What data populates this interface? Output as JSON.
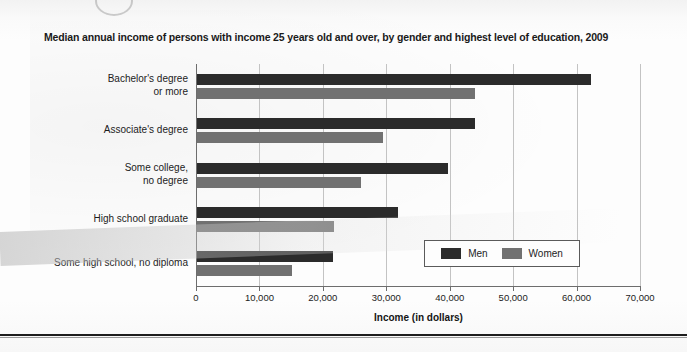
{
  "chart_data": {
    "type": "bar",
    "orientation": "horizontal",
    "title": "Median annual income of persons with income 25 years old and over, by gender and highest level of education, 2009",
    "xlabel": "Income (in dollars)",
    "ylabel": "",
    "xlim": [
      0,
      70000
    ],
    "xticks": [
      0,
      10000,
      20000,
      30000,
      40000,
      50000,
      60000,
      70000
    ],
    "xtick_labels": [
      "0",
      "10,000",
      "20,000",
      "30,000",
      "40,000",
      "50,000",
      "60,000",
      "70,000"
    ],
    "grid": "vertical",
    "legend_position": "inside-lower-right",
    "categories": [
      "Bachelor's degree\nor more",
      "Associate's degree",
      "Some college,\nno degree",
      "High school graduate",
      "Some high school, no diploma"
    ],
    "series": [
      {
        "name": "Men",
        "color": "#2b2b2b",
        "values": [
          62300,
          44000,
          39700,
          31900,
          21600
        ]
      },
      {
        "name": "Women",
        "color": "#717171",
        "values": [
          44000,
          29500,
          26000,
          21800,
          15100
        ]
      }
    ]
  },
  "legend": {
    "items": [
      {
        "label": "Men",
        "color": "#2b2b2b"
      },
      {
        "label": "Women",
        "color": "#717171"
      }
    ]
  },
  "colors": {
    "men": "#2b2b2b",
    "women": "#717171",
    "axis": "#6d6d6d",
    "grid": "#c3c3c3",
    "text": "#1c1c1c",
    "page": "#fdfdfd"
  }
}
